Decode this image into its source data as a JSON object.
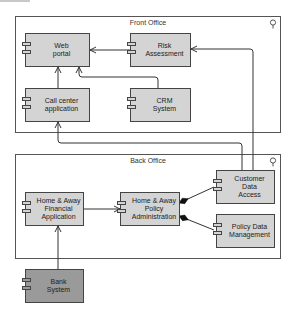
{
  "groups": {
    "front_office": {
      "title": "Front Office"
    },
    "back_office": {
      "title": "Back Office"
    }
  },
  "components": {
    "web_portal": {
      "label": "Web\nportal"
    },
    "risk_assessment": {
      "label": "Risk\nAssessment"
    },
    "call_center": {
      "label": "Call center\napplication"
    },
    "crm_system": {
      "label": "CRM\nSystem"
    },
    "ha_financial": {
      "label": "Home & Away\nFinancial\nApplication"
    },
    "ha_policy_admin": {
      "label": "Home & Away\nPolicy\nAdministration"
    },
    "customer_data_access": {
      "label": "Customer Data\nAccess"
    },
    "policy_data_mgmt": {
      "label": "Policy Data\nManagement"
    },
    "bank_system": {
      "label": "Bank\nSystem"
    }
  },
  "colors": {
    "component_fill": "#d4d4d4",
    "external_fill": "#9a9a9a",
    "border": "#444444"
  }
}
